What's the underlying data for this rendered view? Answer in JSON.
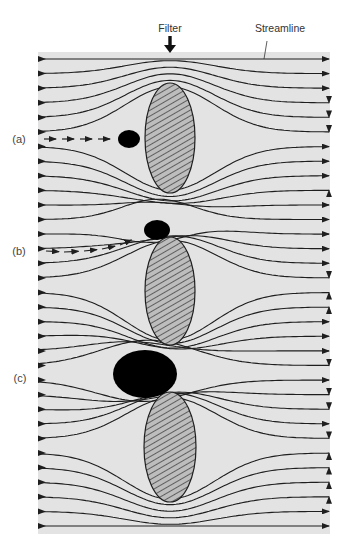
{
  "title_labels": {
    "filter": "Filter",
    "streamline": "Streamline"
  },
  "cases": [
    {
      "id": "a",
      "label": "(a)",
      "description": "Particle follows straight path and is intercepted upstream of filter fiber"
    },
    {
      "id": "b",
      "label": "(b)",
      "description": "Particle follows curving path and lodges at edge of filter fiber"
    },
    {
      "id": "c",
      "label": "(c)",
      "description": "Large particle blocks gap between filter fibers"
    }
  ],
  "diagram": {
    "streamline_count": 33,
    "filter_element_count": 3,
    "filter_elements": [
      {
        "name": "filter-fiber-1",
        "fill": "hatched"
      },
      {
        "name": "filter-fiber-2",
        "fill": "hatched"
      },
      {
        "name": "filter-fiber-3",
        "fill": "hatched"
      }
    ],
    "particles": [
      {
        "case": "a",
        "size": "small"
      },
      {
        "case": "b",
        "size": "small"
      },
      {
        "case": "c",
        "size": "large"
      }
    ],
    "colors": {
      "background_panel": "#e3e3e3",
      "line": "#1e1e1e",
      "particle": "#000000",
      "hatch": "#2a2a2a",
      "hatch_bg": "#b8b8b8"
    }
  }
}
